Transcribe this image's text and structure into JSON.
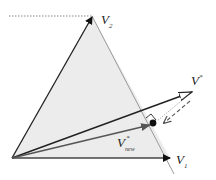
{
  "diagram": {
    "type": "vector-projection",
    "labels": {
      "v2": "V",
      "v2_sub": "2",
      "v1": "V",
      "v1_sub": "1",
      "vstar": "V",
      "vstar_sup": "*",
      "vnew": "V",
      "vnew_sup": "*",
      "vnew_sub": "new"
    },
    "points": {
      "origin": [
        12,
        158
      ],
      "v2": [
        92,
        16
      ],
      "v1": [
        170,
        158
      ],
      "vstar": [
        192,
        92
      ],
      "vnew": [
        152,
        124
      ]
    },
    "colors": {
      "triangle_fill": "#ececec",
      "triangle_edge": "#9a9a9a",
      "vector_dark": "#222222",
      "vector_gray": "#555555",
      "dashed": "#666666",
      "dotted": "#888888"
    }
  }
}
